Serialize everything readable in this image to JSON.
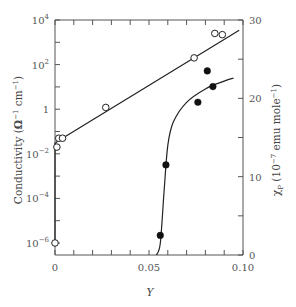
{
  "chart_data": {
    "type": "scatter",
    "title": "",
    "xlabel": "Y",
    "ylabel_left": "Conductivity (Ω⁻¹ cm⁻¹)",
    "ylabel_right": "χP (10⁻⁷ emu mole⁻¹)",
    "xlim": [
      0,
      0.1
    ],
    "ylim_left": [
      1e-06,
      10000.0
    ],
    "ylim_left_scale": "log",
    "ylim_right": [
      0,
      30
    ],
    "grid": false,
    "legend": "none",
    "x_ticks": [
      {
        "value": 0,
        "label": "0"
      },
      {
        "value": 0.05,
        "label": "0.05"
      },
      {
        "value": 0.1,
        "label": "0.10"
      }
    ],
    "y_left_ticks": [
      {
        "value": 10000.0,
        "base": "10",
        "exp": "4"
      },
      {
        "value": 100.0,
        "base": "10",
        "exp": "2"
      },
      {
        "value": 1,
        "base": "1",
        "exp": ""
      },
      {
        "value": 0.01,
        "base": "10",
        "exp": "−2"
      },
      {
        "value": 0.0001,
        "base": "10",
        "exp": "−4"
      },
      {
        "value": 1e-06,
        "base": "10",
        "exp": "−6"
      }
    ],
    "y_right_ticks": [
      {
        "value": 30,
        "label": "30"
      },
      {
        "value": 20,
        "label": "20"
      },
      {
        "value": 10,
        "label": "10"
      },
      {
        "value": 0,
        "label": "0"
      }
    ],
    "series": [
      {
        "name": "Conductivity",
        "axis": "left",
        "marker": "open-circle",
        "points": [
          {
            "x": 0.0,
            "y": 1e-06
          },
          {
            "x": 0.001,
            "y": 0.02
          },
          {
            "x": 0.002,
            "y": 0.05
          },
          {
            "x": 0.004,
            "y": 0.05
          },
          {
            "x": 0.027,
            "y": 1.2
          },
          {
            "x": 0.074,
            "y": 200
          },
          {
            "x": 0.085,
            "y": 2500
          },
          {
            "x": 0.089,
            "y": 2200
          }
        ],
        "fit_line": [
          {
            "x": 0.0,
            "y": 1e-06
          },
          {
            "x": 0.0,
            "y": 0.03
          },
          {
            "x": 0.002,
            "y": 0.04
          },
          {
            "x": 0.098,
            "y": 3500
          }
        ]
      },
      {
        "name": "χP",
        "axis": "right",
        "marker": "filled-circle",
        "points": [
          {
            "x": 0.056,
            "y": 2.5
          },
          {
            "x": 0.059,
            "y": 11.5
          },
          {
            "x": 0.076,
            "y": 19.5
          },
          {
            "x": 0.081,
            "y": 23.5
          },
          {
            "x": 0.084,
            "y": 21.5
          }
        ],
        "fit_curve": [
          {
            "x": 0.054,
            "y": 0
          },
          {
            "x": 0.056,
            "y": 1.5
          },
          {
            "x": 0.058,
            "y": 8
          },
          {
            "x": 0.06,
            "y": 14
          },
          {
            "x": 0.063,
            "y": 17
          },
          {
            "x": 0.07,
            "y": 19.5
          },
          {
            "x": 0.08,
            "y": 21.2
          },
          {
            "x": 0.09,
            "y": 22.2
          },
          {
            "x": 0.095,
            "y": 22.6
          }
        ]
      }
    ]
  },
  "labels": {
    "x_axis": "Y",
    "y_left_main": "Conductivity (",
    "y_left_units": "Ω",
    "y_left_exp1": "−1",
    "y_left_cm": " cm",
    "y_left_exp2": "−1",
    "y_left_close": ")",
    "y_right_chi": "χ",
    "y_right_sub": "P",
    "y_right_rest": " (10",
    "y_right_exp": "−7",
    "y_right_units": " emu mole",
    "y_right_exp2": "−1",
    "y_right_close": ")"
  }
}
